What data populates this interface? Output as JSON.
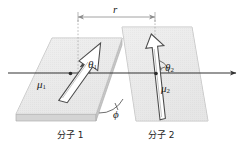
{
  "figure": {
    "background_color": "#ffffff",
    "width": 246,
    "height": 151,
    "colors": {
      "plane_fill": "#e8e8e8",
      "plane_edge": "#b4b4b4",
      "slab_side": "#d0d0d0",
      "axis": "#333333",
      "dimension_line": "#8c8c8c",
      "dotted_guide": "#aaaaaa",
      "arrow_outline": "#4a4a4a",
      "arrow_fill": "#ffffff",
      "text": "#1a1a1a"
    }
  },
  "labels": {
    "distance": "r",
    "dipole_1": "μ",
    "dipole_1_sub": "1",
    "dipole_2": "μ",
    "dipole_2_sub": "2",
    "theta_1": "θ",
    "theta_1_sub": "1",
    "theta_2": "θ",
    "theta_2_sub": "2",
    "phi": "ϕ",
    "molecule_1": "分子 1",
    "molecule_2": "分子 2"
  },
  "geometry": {
    "axis": {
      "x1": 8,
      "y1": 73,
      "x2": 238,
      "y2": 73,
      "arrowhead": "right"
    },
    "dimension": {
      "y": 17,
      "x_left": 78,
      "x_right": 155,
      "arrowheads": "both",
      "value_label": "r"
    },
    "guide_lines": [
      {
        "x": 78,
        "y1": 20,
        "y2": 75,
        "style": "dotted"
      },
      {
        "x": 155,
        "y1": 20,
        "y2": 70,
        "style": "dotted"
      }
    ],
    "plane_1": {
      "label": "分子 1",
      "orientation": "horizontal-slab",
      "corners": [
        [
          52,
          38
        ],
        [
          122,
          38
        ],
        [
          96,
          114
        ],
        [
          16,
          114
        ]
      ],
      "thickness": 7
    },
    "plane_2": {
      "label": "分子 2",
      "orientation": "tilted-vertical",
      "corners": [
        [
          122,
          27
        ],
        [
          192,
          27
        ],
        [
          208,
          121
        ],
        [
          136,
          121
        ]
      ]
    },
    "dipole_vector_1": {
      "origin": [
        70,
        74
      ],
      "tip": [
        100,
        42
      ],
      "tail": [
        56,
        98
      ],
      "angle_from_axis_deg": 47,
      "style": "hollow-outlined-arrow"
    },
    "dipole_vector_2": {
      "origin": [
        156,
        74
      ],
      "tip": [
        151,
        36
      ],
      "tail": [
        163,
        118
      ],
      "angle_from_axis_deg": 82,
      "style": "hollow-outlined-arrow"
    },
    "angle_arc_theta1": {
      "center": [
        70,
        74
      ],
      "radius": 20,
      "from_deg": 0,
      "to_deg": 47
    },
    "angle_arc_theta2": {
      "center": [
        156,
        74
      ],
      "radius": 14,
      "from_deg": 0,
      "to_deg": 82
    },
    "angle_arc_phi": {
      "center": [
        120,
        113
      ],
      "radius": 22,
      "label": "ϕ"
    }
  }
}
